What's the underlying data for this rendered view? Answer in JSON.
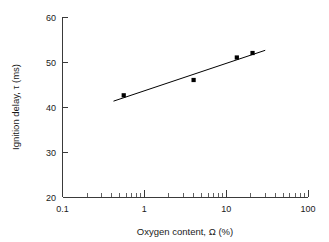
{
  "chart_data": {
    "type": "scatter",
    "title": "",
    "xlabel": "Oxygen content,  Ω (%)",
    "ylabel": "Ignition delay, τ (ms)",
    "xscale": "log",
    "yscale": "linear",
    "xlim": [
      0.1,
      100
    ],
    "ylim": [
      20,
      60
    ],
    "grid": false,
    "legend": "none",
    "x_ticks": [
      {
        "value": 0.1,
        "label": "0.1"
      },
      {
        "value": 1,
        "label": "1"
      },
      {
        "value": 10,
        "label": "10"
      },
      {
        "value": 100,
        "label": "100"
      }
    ],
    "y_ticks": [
      {
        "value": 20,
        "label": "20"
      },
      {
        "value": 30,
        "label": "30"
      },
      {
        "value": 40,
        "label": "40"
      },
      {
        "value": 50,
        "label": "50"
      },
      {
        "value": 60,
        "label": "60"
      }
    ],
    "x_minor_ticks": [
      0.2,
      0.3,
      0.4,
      0.5,
      0.6,
      0.7,
      0.8,
      0.9,
      2,
      3,
      4,
      5,
      6,
      7,
      8,
      9,
      20,
      30,
      40,
      50,
      60,
      70,
      80,
      90
    ],
    "series": [
      {
        "name": "Measured ignition delay",
        "marker": "square",
        "color": "#000000",
        "points": [
          {
            "x": 0.56,
            "y": 42.6
          },
          {
            "x": 4.0,
            "y": 46.0
          },
          {
            "x": 13.5,
            "y": 51.0
          },
          {
            "x": 21.0,
            "y": 52.0
          }
        ]
      }
    ],
    "fit_line": {
      "name": "Linear fit (log x)",
      "color": "#000000",
      "x_start": 0.42,
      "y_start": 41.3,
      "x_end": 30.0,
      "y_end": 52.6
    }
  }
}
